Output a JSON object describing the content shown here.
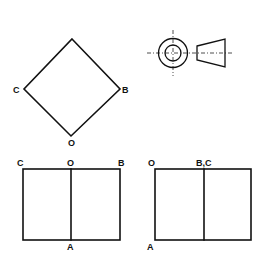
{
  "figure": {
    "isometric_view": {
      "shape": "square rotated 45° (diamond)",
      "labels": {
        "left": "C",
        "right": "B",
        "bottom": "O"
      }
    },
    "reference_symbol": {
      "name": "first-angle projection symbol",
      "parts": [
        "concentric circles with center lines",
        "truncated cone (trapezoid)"
      ]
    },
    "front_view": {
      "labels": {
        "top_left": "C",
        "top_middle": "O",
        "top_right": "B",
        "bottom_middle": "A"
      }
    },
    "side_view": {
      "labels": {
        "top_left": "O",
        "top_middle": "B,C",
        "bottom_left": "A"
      }
    }
  }
}
